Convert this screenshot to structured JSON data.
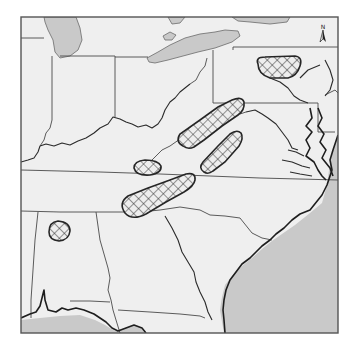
{
  "map": {
    "type": "regional outline map (eastern United States)",
    "north_arrow": {
      "label": "N",
      "icon": "north-arrow-icon"
    },
    "colors": {
      "land": "#efefef",
      "water": "#c9c9c9",
      "borders": "#4a4a4a",
      "hatched_zone_stroke": "#262626",
      "frame": "#555555"
    },
    "hatched_zones": [
      {
        "id": "zone-northern-pennsylvania",
        "pattern": "crosshatch"
      },
      {
        "id": "zone-west-virginia-ridge",
        "pattern": "crosshatch"
      },
      {
        "id": "zone-virginia-ridge",
        "pattern": "crosshatch"
      },
      {
        "id": "zone-tennessee-kentucky-border",
        "pattern": "crosshatch"
      },
      {
        "id": "zone-tennessee-georgia-ridge",
        "pattern": "crosshatch"
      },
      {
        "id": "zone-northern-alabama-mississippi",
        "pattern": "crosshatch"
      }
    ],
    "water_bodies": [
      "Lake Michigan",
      "Lake Erie",
      "Lake Ontario (edge)",
      "Atlantic Ocean",
      "Gulf of Mexico"
    ]
  }
}
